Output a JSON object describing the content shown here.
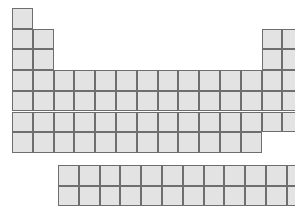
{
  "figure": {
    "kind": "periodic-table-schematic",
    "background_color": "#ffffff"
  },
  "colors": {
    "cell_fill": "#e3e3e3",
    "cell_border": "#6e6e6e",
    "highlight_fill": "#8a8a8a",
    "highlight_border": "#5a5a5a"
  },
  "geometry": {
    "cell_width": 20.8,
    "cell_height": 20.7,
    "main_origin_x": 12,
    "main_origin_y": 8,
    "fblock_origin_x": 58,
    "fblock_origin_y": 165,
    "fblock_columns": 14,
    "fblock_rows": 2
  },
  "chart_data": {
    "type": "table",
    "title": "",
    "xlabel": "",
    "ylabel": "",
    "groups": 18,
    "periods": 7,
    "main_grid": [
      {
        "period": 1,
        "groups": [
          1,
          18
        ]
      },
      {
        "period": 2,
        "groups": [
          1,
          2,
          13,
          14,
          15,
          16,
          17,
          18
        ]
      },
      {
        "period": 3,
        "groups": [
          1,
          2,
          13,
          14,
          15,
          16,
          17,
          18
        ]
      },
      {
        "period": 4,
        "groups": [
          1,
          2,
          3,
          4,
          5,
          6,
          7,
          8,
          9,
          10,
          11,
          12,
          13,
          14,
          15,
          16,
          17,
          18
        ]
      },
      {
        "period": 5,
        "groups": [
          1,
          2,
          3,
          4,
          5,
          6,
          7,
          8,
          9,
          10,
          11,
          12,
          13,
          14,
          15,
          16,
          17,
          18
        ]
      },
      {
        "period": 6,
        "groups": [
          1,
          2,
          3,
          4,
          5,
          6,
          7,
          8,
          9,
          10,
          11,
          12,
          13,
          14,
          15,
          16,
          17,
          18
        ]
      },
      {
        "period": 7,
        "groups": [
          1,
          2,
          3,
          4,
          5,
          6,
          7,
          8,
          9,
          10,
          11,
          12
        ]
      }
    ],
    "fblock_rows": [
      {
        "row": 1,
        "cells": 14
      },
      {
        "row": 2,
        "cells": 14
      }
    ],
    "highlighted_cells": [
      {
        "group": 16,
        "period": 2
      },
      {
        "group": 16,
        "period": 3
      }
    ],
    "legend": [],
    "annotations": []
  }
}
